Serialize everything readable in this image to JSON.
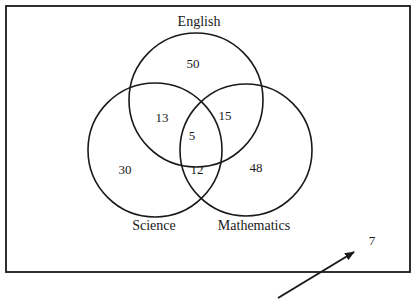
{
  "diagram": {
    "type": "venn",
    "sets": [
      {
        "name": "English",
        "only": "50"
      },
      {
        "name": "Science",
        "only": "30"
      },
      {
        "name": "Mathematics",
        "only": "48"
      }
    ],
    "regions": {
      "english_only": "50",
      "science_only": "30",
      "mathematics_only": "48",
      "english_science": "13",
      "english_mathematics": "15",
      "science_mathematics": "12",
      "all_three": "5",
      "outside": "7"
    },
    "labels": {
      "english": "English",
      "science": "Science",
      "mathematics": "Mathematics"
    },
    "colors": {
      "stroke": "#1a1a1a",
      "background": "#ffffff"
    }
  }
}
